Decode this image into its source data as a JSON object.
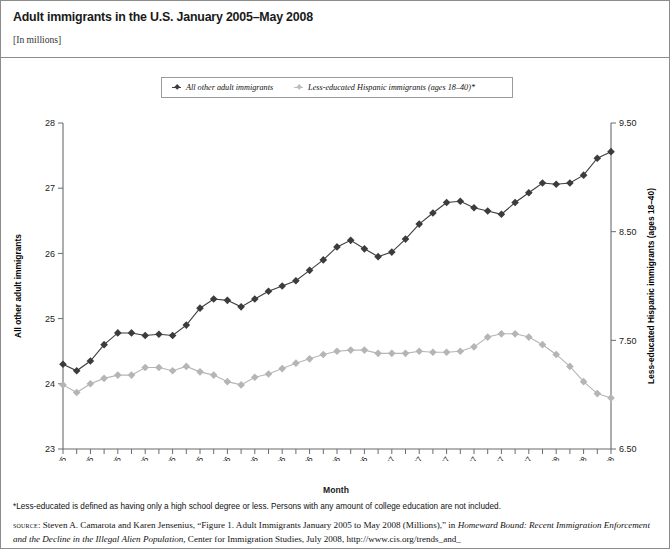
{
  "header": {
    "title": "Adult immigrants in the U.S. January 2005–May 2008",
    "subtitle": "[In millions]"
  },
  "legend": {
    "items": [
      {
        "label": "All other adult immigrants",
        "color": "#3c3c3c"
      },
      {
        "label": "Less-educated Hispanic immigrants (ages 18–40)*",
        "color": "#b5b5b5"
      }
    ]
  },
  "footer": {
    "footnote": "*Less-educated is defined as having only a high school degree or less. Persons with any amount of college education are not included.",
    "source_label": "source",
    "source_line1_a": ": Steven A. Camarota and Karen Jensenius, “Figure 1. Adult Immigrants January 2005 to May 2008 (Millions),” in ",
    "source_line1_em": "Homeward Bound: Recent",
    "source_line2_em": "Immigration Enforcement and the Decline in the Illegal Alien Population,",
    "source_line2_b": " Center for Immigration Studies, July 2008, http://www.cis.org/trends_and_"
  },
  "chart_data": {
    "type": "line",
    "title": "Adult immigrants in the U.S. January 2005–May 2008",
    "subtitle": "[In millions]",
    "xlabel": "Month",
    "ylabel": "All other adult immigrants",
    "y2label": "Less-educated Hispanic immigrants (ages 18–40)",
    "ylim": [
      23,
      28
    ],
    "y2lim": [
      6.5,
      9.5
    ],
    "yticks": [
      "23",
      "24",
      "25",
      "26",
      "27",
      "28"
    ],
    "y2ticks": [
      "6.50",
      "7.50",
      "8.50",
      "9.50"
    ],
    "grid": false,
    "legend_position": "top-center",
    "x": [
      "Jan-05",
      "Feb-05",
      "Mar-05",
      "Apr-05",
      "May-05",
      "Jun-05",
      "Jul-05",
      "Aug-05",
      "Sep-05",
      "Oct-05",
      "Nov-05",
      "Dec-05",
      "Jan-06",
      "Feb-06",
      "Mar-06",
      "Apr-06",
      "May-06",
      "Jun-06",
      "Jul-06",
      "Aug-06",
      "Sep-06",
      "Oct-06",
      "Nov-06",
      "Dec-06",
      "Jan-07",
      "Feb-07",
      "Mar-07",
      "Apr-07",
      "May-07",
      "Jun-07",
      "Jul-07",
      "Aug-07",
      "Sep-07",
      "Oct-07",
      "Nov-07",
      "Dec-07",
      "Jan-08",
      "Feb-08",
      "Mar-08",
      "Apr-08",
      "May-08"
    ],
    "xtick_labels": [
      "Jan-05",
      "Mar-05",
      "May-05",
      "Jul-05",
      "Sep-05",
      "Nov-05",
      "Jan-06",
      "Mar-06",
      "May-06",
      "Jul-06",
      "Sep-06",
      "Nov-06",
      "Jan-07",
      "Mar-07",
      "May-07",
      "Jul-07",
      "Sep-07",
      "Nov-07",
      "Jan-08",
      "Mar-08",
      "May-08"
    ],
    "xtick_every": 2,
    "series": [
      {
        "name": "All other adult immigrants",
        "axis": "left",
        "color": "#3c3c3c",
        "units": "millions",
        "values": [
          24.3,
          24.2,
          24.35,
          24.6,
          24.78,
          24.78,
          24.74,
          24.76,
          24.74,
          24.9,
          25.16,
          25.3,
          25.28,
          25.18,
          25.3,
          25.42,
          25.5,
          25.58,
          25.74,
          25.9,
          26.1,
          26.2,
          26.07,
          25.95,
          26.02,
          26.22,
          26.45,
          26.62,
          26.78,
          26.8,
          26.7,
          26.65,
          26.6,
          26.78,
          26.93,
          27.08,
          27.06,
          27.08,
          27.2,
          27.46,
          27.56
        ]
      },
      {
        "name": "Less-educated Hispanic immigrants (ages 18–40)",
        "axis": "right",
        "color": "#b5b5b5",
        "units": "millions",
        "values": [
          7.09,
          7.02,
          7.1,
          7.15,
          7.18,
          7.18,
          7.25,
          7.25,
          7.22,
          7.26,
          7.21,
          7.18,
          7.12,
          7.09,
          7.16,
          7.19,
          7.24,
          7.29,
          7.33,
          7.37,
          7.4,
          7.41,
          7.41,
          7.38,
          7.38,
          7.38,
          7.4,
          7.39,
          7.39,
          7.4,
          7.44,
          7.53,
          7.56,
          7.56,
          7.53,
          7.46,
          7.37,
          7.26,
          7.12,
          7.01,
          6.97
        ]
      }
    ]
  }
}
